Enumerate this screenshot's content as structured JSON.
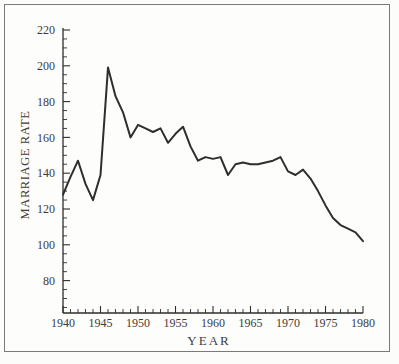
{
  "chart": {
    "xlabel": "YEAR",
    "ylabel": "MARRIAGE RATE"
  },
  "chart_data": {
    "type": "line",
    "title": "",
    "xlabel": "YEAR",
    "ylabel": "MARRIAGE RATE",
    "x": [
      1940,
      1941,
      1942,
      1943,
      1944,
      1945,
      1946,
      1947,
      1948,
      1949,
      1950,
      1951,
      1952,
      1953,
      1954,
      1955,
      1956,
      1957,
      1958,
      1959,
      1960,
      1961,
      1962,
      1963,
      1964,
      1965,
      1966,
      1967,
      1968,
      1969,
      1970,
      1971,
      1972,
      1973,
      1974,
      1975,
      1976,
      1977,
      1978,
      1979,
      1980
    ],
    "values": [
      128,
      138,
      147,
      134,
      125,
      139,
      199,
      183,
      174,
      160,
      167,
      165,
      163,
      165,
      157,
      162,
      166,
      155,
      147,
      149,
      148,
      149,
      139,
      145,
      146,
      145,
      145,
      146,
      147,
      149,
      141,
      139,
      142,
      137,
      130,
      122,
      115,
      111,
      109,
      107,
      102
    ],
    "x_tick_labels": [
      "1940",
      "1945",
      "1950",
      "1955",
      "1960",
      "1965",
      "1970",
      "1975",
      "1980"
    ],
    "y_tick_labels": [
      "220",
      "200",
      "180",
      "160",
      "140",
      "120",
      "100",
      "80"
    ],
    "x_minor_tick_step": 1,
    "y_minor_tick_step": 5,
    "xlim": [
      1940,
      1980
    ],
    "ylim": [
      62,
      221
    ],
    "grid": false,
    "legend": "none",
    "line_color": "#2e2e2e",
    "axis_color": "#2e2e2e",
    "text_color": "#3c3c3c",
    "frame_color": "#7a7a78",
    "background": "#fcfcfa"
  }
}
